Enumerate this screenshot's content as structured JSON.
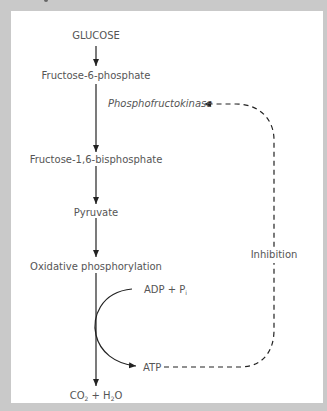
{
  "diagram": {
    "title_cut": "",
    "nodes": {
      "glucose": "GLUCOSE",
      "f6p": "Fructose-6-phosphate",
      "enzyme": "Phosphofructokinase",
      "f16bp": "Fructose-1,6-bisphosphate",
      "pyruvate": "Pyruvate",
      "oxphos": "Oxidative phosphorylation",
      "adp": "ADP + P",
      "adp_sub": "i",
      "atp": "ATP",
      "co2": "CO",
      "co2_sub": "2",
      "plus_h": " + H",
      "h2o_sub": "2",
      "o": "O",
      "inhibition": "Inhibition"
    },
    "colors": {
      "background": "#c9c9c9",
      "panel": "#ffffff",
      "text": "#555555",
      "line": "#222222"
    }
  }
}
